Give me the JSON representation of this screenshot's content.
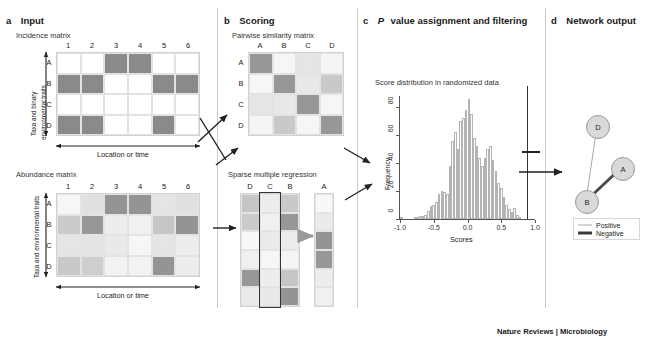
{
  "figure": {
    "source_credit": "Nature Reviews | Microbiology"
  },
  "panels": {
    "a": {
      "letter": "a",
      "title": "Input",
      "incidence": {
        "caption": "Incidence matrix",
        "col_headers": [
          "1",
          "2",
          "3",
          "4",
          "5",
          "6"
        ],
        "row_headers": [
          "A",
          "B",
          "C",
          "D"
        ],
        "y_axis_label": "Taxa and binary environmental traits",
        "x_axis_label": "Location or time",
        "values": [
          [
            0,
            0,
            1,
            1,
            0,
            0
          ],
          [
            1,
            1,
            0,
            0,
            1,
            1
          ],
          [
            0,
            0,
            0,
            0,
            0,
            0
          ],
          [
            1,
            1,
            0,
            0,
            1,
            0
          ]
        ]
      },
      "abundance": {
        "caption": "Abundance matrix",
        "col_headers": [
          "1",
          "2",
          "3",
          "4",
          "5",
          "6"
        ],
        "row_headers": [
          "A",
          "B",
          "C",
          "D"
        ],
        "y_axis_label": "Taxa and environmental traits",
        "x_axis_label": "Location or time",
        "values": [
          [
            0.05,
            0.22,
            0.8,
            0.8,
            0.18,
            0.22
          ],
          [
            0.38,
            0.78,
            0.12,
            0.1,
            0.42,
            0.8
          ],
          [
            0.18,
            0.2,
            0.15,
            0.05,
            0.18,
            0.12
          ],
          [
            0.4,
            0.36,
            0.08,
            0.08,
            0.8,
            0.12
          ]
        ]
      }
    },
    "b": {
      "letter": "b",
      "title": "Scoring",
      "similarity": {
        "caption": "Pairwise similarity matrix",
        "col_headers": [
          "A",
          "B",
          "C",
          "D"
        ],
        "row_headers": [
          "A",
          "B",
          "C",
          "D"
        ],
        "values": [
          [
            0.78,
            0.05,
            0.18,
            0.06
          ],
          [
            0.05,
            0.78,
            0.16,
            0.4
          ],
          [
            0.18,
            0.16,
            0.78,
            0.05
          ],
          [
            0.06,
            0.4,
            0.05,
            0.78
          ]
        ]
      },
      "regression": {
        "caption": "Sparse multiple regression",
        "predictor_headers": [
          "D",
          "C",
          "B"
        ],
        "response_header": "A",
        "highlight_column_index": 1,
        "predictor_values": [
          [
            0.42,
            0.12,
            0.4
          ],
          [
            0.38,
            0.1,
            0.78
          ],
          [
            0.04,
            0.14,
            0.12
          ],
          [
            0.1,
            0.05,
            0.06
          ],
          [
            0.78,
            0.12,
            0.42
          ],
          [
            0.14,
            0.16,
            0.8
          ]
        ],
        "response_values": [
          0.04,
          0.14,
          0.8,
          0.78,
          0.12,
          0.1
        ]
      }
    },
    "c": {
      "letter": "c",
      "title_italic": "P",
      "title": "value assignment and filtering",
      "title_full": "P value assignment and filtering"
    },
    "d": {
      "letter": "d",
      "title": "Network output",
      "nodes": [
        {
          "id": "D",
          "label": "D"
        },
        {
          "id": "A",
          "label": "A"
        },
        {
          "id": "B",
          "label": "B"
        }
      ],
      "edges": [
        {
          "from": "D",
          "to": "B",
          "type": "Positive"
        },
        {
          "from": "A",
          "to": "B",
          "type": "Negative"
        }
      ],
      "legend": [
        {
          "label": "Positive",
          "style": "thin"
        },
        {
          "label": "Negative",
          "style": "thick"
        }
      ]
    }
  },
  "chart_data": {
    "type": "bar",
    "title": "Score distribution in randomized data",
    "xlabel": "Scores",
    "ylabel": "Frequency",
    "xlim": [
      -1.0,
      1.0
    ],
    "ylim": [
      0,
      88
    ],
    "xticks": [
      "-1.0",
      "-0.5",
      "0.0",
      "0.5",
      "1.0"
    ],
    "xtick_values": [
      -1.0,
      -0.5,
      0.0,
      0.5,
      1.0
    ],
    "yticks": [
      "0",
      "20",
      "40",
      "60",
      "80"
    ],
    "ytick_values": [
      0,
      20,
      40,
      60,
      80
    ],
    "grid": false,
    "legend": "none",
    "bin_width": 0.04,
    "bin_centers": [
      -0.98,
      -0.94,
      -0.9,
      -0.86,
      -0.82,
      -0.78,
      -0.74,
      -0.7,
      -0.66,
      -0.62,
      -0.58,
      -0.54,
      -0.5,
      -0.46,
      -0.42,
      -0.38,
      -0.34,
      -0.3,
      -0.26,
      -0.22,
      -0.18,
      -0.14,
      -0.1,
      -0.06,
      -0.02,
      0.02,
      0.06,
      0.1,
      0.14,
      0.18,
      0.22,
      0.26,
      0.3,
      0.34,
      0.38,
      0.42,
      0.46,
      0.5,
      0.54,
      0.58,
      0.62,
      0.66,
      0.7,
      0.74,
      0.78,
      0.82,
      0.86,
      0.9
    ],
    "values": [
      1,
      0,
      0,
      0,
      0,
      1,
      1,
      2,
      2,
      3,
      6,
      9,
      10,
      12,
      18,
      20,
      19,
      18,
      38,
      56,
      62,
      50,
      70,
      72,
      78,
      86,
      75,
      58,
      52,
      44,
      38,
      44,
      50,
      52,
      42,
      34,
      26,
      22,
      16,
      10,
      7,
      5,
      8,
      3,
      1,
      0,
      0,
      0
    ],
    "annotations": [
      {
        "type": "vline",
        "x": 0.88,
        "label": "significance threshold"
      }
    ]
  }
}
